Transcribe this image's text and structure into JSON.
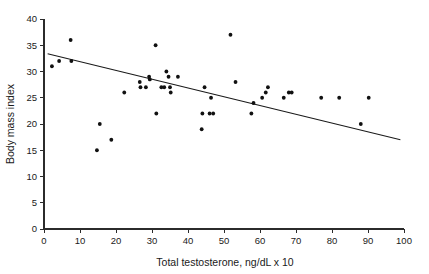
{
  "chart_data": {
    "type": "scatter",
    "title": "",
    "subtitle": "",
    "xlabel": "Total testosterone, ng/dL x 10",
    "ylabel": "Body mass index",
    "xlim": [
      0,
      100
    ],
    "ylim": [
      0,
      40
    ],
    "xticks": [
      0,
      10,
      20,
      30,
      40,
      50,
      60,
      70,
      80,
      90,
      100
    ],
    "yticks": [
      0,
      5,
      10,
      15,
      20,
      25,
      30,
      35,
      40
    ],
    "xtick_labels": [
      "0",
      "10",
      "20",
      "30",
      "40",
      "50",
      "60",
      "70",
      "80",
      "90",
      "100"
    ],
    "ytick_labels": [
      "0",
      "5",
      "10",
      "15",
      "20",
      "25",
      "30",
      "35",
      "40"
    ],
    "grid": false,
    "legend": null,
    "legend_position": "none",
    "marker": "dot",
    "marker_color": "#111111",
    "series": [
      {
        "name": "Subjects",
        "points": [
          [
            2.2,
            31.0
          ],
          [
            4.2,
            32.0
          ],
          [
            7.4,
            36.0
          ],
          [
            7.6,
            32.0
          ],
          [
            14.7,
            15.0
          ],
          [
            15.5,
            20.0
          ],
          [
            18.7,
            17.0
          ],
          [
            22.3,
            26.0
          ],
          [
            26.6,
            28.0
          ],
          [
            26.8,
            27.0
          ],
          [
            28.3,
            27.0
          ],
          [
            29.2,
            29.0
          ],
          [
            29.4,
            28.5
          ],
          [
            31.0,
            35.0
          ],
          [
            31.2,
            22.0
          ],
          [
            32.6,
            27.0
          ],
          [
            33.4,
            27.0
          ],
          [
            34.0,
            30.0
          ],
          [
            34.6,
            29.0
          ],
          [
            35.0,
            27.0
          ],
          [
            35.2,
            26.0
          ],
          [
            37.2,
            29.0
          ],
          [
            43.8,
            19.0
          ],
          [
            44.0,
            22.0
          ],
          [
            44.6,
            27.0
          ],
          [
            46.0,
            22.0
          ],
          [
            46.4,
            25.0
          ],
          [
            47.0,
            22.0
          ],
          [
            51.8,
            37.0
          ],
          [
            53.2,
            28.0
          ],
          [
            57.6,
            22.0
          ],
          [
            58.2,
            24.0
          ],
          [
            60.6,
            25.0
          ],
          [
            61.6,
            26.0
          ],
          [
            62.2,
            27.0
          ],
          [
            66.6,
            25.0
          ],
          [
            68.0,
            26.0
          ],
          [
            68.8,
            26.0
          ],
          [
            77.0,
            25.0
          ],
          [
            82.0,
            25.0
          ],
          [
            88.0,
            20.0
          ],
          [
            90.2,
            25.0
          ]
        ]
      }
    ],
    "fit_line": {
      "name": "Linear regression",
      "x_start": 1.0,
      "y_start": 33.4,
      "x_end": 99.0,
      "y_end": 17.0
    }
  }
}
